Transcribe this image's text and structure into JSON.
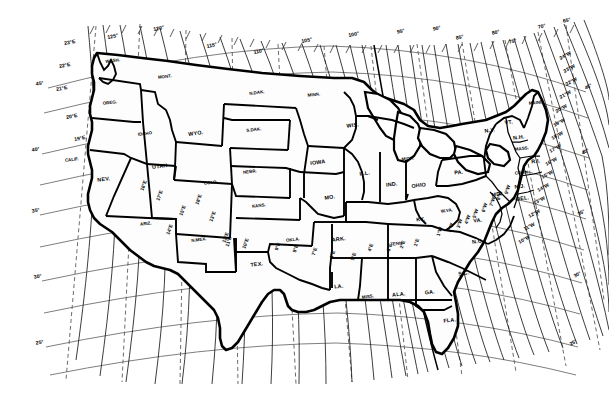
{
  "map": {
    "title": "Isogonic Chart of the United States",
    "subject": "magnetic declination",
    "projection": "conic",
    "background_color": "#ffffff",
    "line_color": "#000000",
    "graticule_color": "#6f6f6f"
  },
  "graticule": {
    "longitude_labels": [
      "125°",
      "120°",
      "115°",
      "110°",
      "105°",
      "100°",
      "95°",
      "90°",
      "85°",
      "80°",
      "75°",
      "70°",
      "65°"
    ],
    "latitude_labels_left": [
      "45°",
      "40°",
      "35°",
      "30°",
      "25°"
    ],
    "latitude_labels_right": [
      "45°",
      "40°",
      "35°",
      "30°",
      "25°"
    ]
  },
  "declination": {
    "east_labels": [
      "23°E",
      "22°E",
      "21°E",
      "20°E",
      "19°E",
      "18°E",
      "17°E",
      "16°E",
      "15°E",
      "14°E",
      "13°E",
      "12°E",
      "11°E",
      "10°E",
      "9°E",
      "8°E",
      "7°E",
      "6°E",
      "5°E",
      "4°E",
      "3°E",
      "2°E",
      "1°E"
    ],
    "west_labels": [
      "24°W",
      "23°W",
      "22°W",
      "21°W",
      "20°W",
      "19°W",
      "18°W",
      "17°W",
      "16°W",
      "15°W",
      "14°W",
      "13°W",
      "12°W",
      "11°W",
      "10°W",
      "9°W",
      "8°W",
      "7°W",
      "6°W",
      "5°W",
      "4°W",
      "3°W",
      "2°W",
      "1°W"
    ]
  },
  "edge_labels": {
    "left": [
      {
        "text": "23°E",
        "x": 70,
        "y": 44
      },
      {
        "text": "22°E",
        "x": 65,
        "y": 67
      },
      {
        "text": "21°E",
        "x": 62,
        "y": 90
      },
      {
        "text": "20°E",
        "x": 72,
        "y": 118
      },
      {
        "text": "19°E",
        "x": 80,
        "y": 140
      },
      {
        "text": "45°",
        "x": 40,
        "y": 85
      },
      {
        "text": "40°",
        "x": 36,
        "y": 151
      },
      {
        "text": "35°",
        "x": 36,
        "y": 212
      },
      {
        "text": "30°",
        "x": 38,
        "y": 278
      },
      {
        "text": "25°",
        "x": 40,
        "y": 344
      }
    ],
    "top": [
      {
        "text": "125°",
        "x": 113,
        "y": 38
      },
      {
        "text": "120°",
        "x": 159,
        "y": 30
      },
      {
        "text": "115°",
        "x": 212,
        "y": 47
      },
      {
        "text": "110°",
        "x": 259,
        "y": 53
      },
      {
        "text": "105°",
        "x": 307,
        "y": 42
      },
      {
        "text": "100°",
        "x": 354,
        "y": 36
      },
      {
        "text": "95°",
        "x": 401,
        "y": 33
      },
      {
        "text": "90°",
        "x": 437,
        "y": 30
      },
      {
        "text": "85°",
        "x": 460,
        "y": 39
      },
      {
        "text": "80°",
        "x": 496,
        "y": 34
      },
      {
        "text": "75°",
        "x": 513,
        "y": 43
      },
      {
        "text": "70°",
        "x": 542,
        "y": 28
      },
      {
        "text": "65°",
        "x": 567,
        "y": 22
      }
    ],
    "right": [
      {
        "text": "24°W",
        "x": 566,
        "y": 57
      },
      {
        "text": "23°W",
        "x": 570,
        "y": 70
      },
      {
        "text": "22°W",
        "x": 572,
        "y": 83
      },
      {
        "text": "21°W",
        "x": 566,
        "y": 96
      },
      {
        "text": "20°W",
        "x": 562,
        "y": 110
      },
      {
        "text": "19°W",
        "x": 560,
        "y": 124
      },
      {
        "text": "18°W",
        "x": 558,
        "y": 137
      },
      {
        "text": "17°W",
        "x": 556,
        "y": 150
      },
      {
        "text": "16°W",
        "x": 552,
        "y": 163
      },
      {
        "text": "15°W",
        "x": 548,
        "y": 176
      },
      {
        "text": "14°W",
        "x": 544,
        "y": 189
      },
      {
        "text": "13°W",
        "x": 540,
        "y": 202
      },
      {
        "text": "12°W",
        "x": 535,
        "y": 215
      },
      {
        "text": "11°W",
        "x": 530,
        "y": 228
      },
      {
        "text": "10°W",
        "x": 525,
        "y": 241
      },
      {
        "text": "45°",
        "x": 589,
        "y": 88
      },
      {
        "text": "40°",
        "x": 586,
        "y": 153
      },
      {
        "text": "35°",
        "x": 582,
        "y": 214
      },
      {
        "text": "30°",
        "x": 578,
        "y": 276
      },
      {
        "text": "25°",
        "x": 574,
        "y": 344
      }
    ],
    "interior": [
      {
        "text": "15°E",
        "x": 184,
        "y": 211
      },
      {
        "text": "14°E",
        "x": 171,
        "y": 230
      },
      {
        "text": "13°E",
        "x": 214,
        "y": 217
      },
      {
        "text": "12°E",
        "x": 227,
        "y": 238
      },
      {
        "text": "11°E",
        "x": 230,
        "y": 242
      },
      {
        "text": "10°E",
        "x": 247,
        "y": 244
      },
      {
        "text": "9°E",
        "x": 279,
        "y": 247
      },
      {
        "text": "8°E",
        "x": 297,
        "y": 249
      },
      {
        "text": "7°E",
        "x": 316,
        "y": 252
      },
      {
        "text": "6°E",
        "x": 334,
        "y": 255
      },
      {
        "text": "5°E",
        "x": 355,
        "y": 257
      },
      {
        "text": "4°E",
        "x": 372,
        "y": 248
      },
      {
        "text": "3°E",
        "x": 391,
        "y": 248
      },
      {
        "text": "2°E",
        "x": 404,
        "y": 245
      },
      {
        "text": "1°E",
        "x": 418,
        "y": 243
      },
      {
        "text": "1°W",
        "x": 441,
        "y": 232
      },
      {
        "text": "2°W",
        "x": 452,
        "y": 228
      },
      {
        "text": "3°W",
        "x": 461,
        "y": 224
      },
      {
        "text": "4°W",
        "x": 469,
        "y": 220
      },
      {
        "text": "5°W",
        "x": 477,
        "y": 214
      },
      {
        "text": "6°W",
        "x": 486,
        "y": 208
      },
      {
        "text": "7°W",
        "x": 494,
        "y": 202
      },
      {
        "text": "8°W",
        "x": 501,
        "y": 196
      },
      {
        "text": "9°W",
        "x": 509,
        "y": 190
      },
      {
        "text": "18°E",
        "x": 200,
        "y": 200
      },
      {
        "text": "17°E",
        "x": 161,
        "y": 196
      },
      {
        "text": "16°E",
        "x": 145,
        "y": 186
      }
    ]
  },
  "states": [
    {
      "abbr": "WASH.",
      "x": 113,
      "y": 62
    },
    {
      "abbr": "OREG.",
      "x": 110,
      "y": 104
    },
    {
      "abbr": "CALIF.",
      "x": 72,
      "y": 161
    },
    {
      "abbr": "NEV.",
      "x": 104,
      "y": 181
    },
    {
      "abbr": "IDAHO",
      "x": 145,
      "y": 135
    },
    {
      "abbr": "MONT.",
      "x": 165,
      "y": 78
    },
    {
      "abbr": "WYO.",
      "x": 196,
      "y": 135
    },
    {
      "abbr": "UTAH",
      "x": 160,
      "y": 168
    },
    {
      "abbr": "COLO.",
      "x": 211,
      "y": 184
    },
    {
      "abbr": "ARIZ.",
      "x": 146,
      "y": 225
    },
    {
      "abbr": "N.MEX.",
      "x": 199,
      "y": 241
    },
    {
      "abbr": "TEX.",
      "x": 257,
      "y": 266
    },
    {
      "abbr": "OKLA.",
      "x": 293,
      "y": 241
    },
    {
      "abbr": "KANS.",
      "x": 259,
      "y": 207
    },
    {
      "abbr": "NEBR.",
      "x": 250,
      "y": 173
    },
    {
      "abbr": "S.DAK.",
      "x": 254,
      "y": 131
    },
    {
      "abbr": "N.DAK.",
      "x": 257,
      "y": 94
    },
    {
      "abbr": "MINN.",
      "x": 314,
      "y": 96
    },
    {
      "abbr": "IOWA",
      "x": 318,
      "y": 164
    },
    {
      "abbr": "MO.",
      "x": 330,
      "y": 199
    },
    {
      "abbr": "ARK.",
      "x": 339,
      "y": 241
    },
    {
      "abbr": "LA.",
      "x": 339,
      "y": 288
    },
    {
      "abbr": "MISS.",
      "x": 368,
      "y": 298
    },
    {
      "abbr": "ALA.",
      "x": 399,
      "y": 296
    },
    {
      "abbr": "GA.",
      "x": 430,
      "y": 294
    },
    {
      "abbr": "FLA.",
      "x": 450,
      "y": 322
    },
    {
      "abbr": "TENN.",
      "x": 397,
      "y": 245
    },
    {
      "abbr": "KY.",
      "x": 421,
      "y": 221
    },
    {
      "abbr": "ILL.",
      "x": 365,
      "y": 175
    },
    {
      "abbr": "IND.",
      "x": 392,
      "y": 186
    },
    {
      "abbr": "OHIO",
      "x": 419,
      "y": 187
    },
    {
      "abbr": "MICH.",
      "x": 408,
      "y": 160
    },
    {
      "abbr": "WIS.",
      "x": 353,
      "y": 127
    },
    {
      "abbr": "W.VA.",
      "x": 447,
      "y": 212
    },
    {
      "abbr": "VA.",
      "x": 478,
      "y": 222
    },
    {
      "abbr": "N.C.",
      "x": 478,
      "y": 243
    },
    {
      "abbr": "S.C.",
      "x": 464,
      "y": 275
    },
    {
      "abbr": "PA.",
      "x": 459,
      "y": 174
    },
    {
      "abbr": "N.Y.",
      "x": 490,
      "y": 132
    },
    {
      "abbr": "VT.",
      "x": 509,
      "y": 124
    },
    {
      "abbr": "N.H.",
      "x": 519,
      "y": 139
    },
    {
      "abbr": "MASS.",
      "x": 522,
      "y": 150
    },
    {
      "abbr": "R.I.",
      "x": 536,
      "y": 163
    },
    {
      "abbr": "CONN.",
      "x": 522,
      "y": 174
    },
    {
      "abbr": "N.J.",
      "x": 520,
      "y": 188
    },
    {
      "abbr": "DEL.",
      "x": 523,
      "y": 200
    },
    {
      "abbr": "MD.",
      "x": 497,
      "y": 196
    },
    {
      "abbr": "MAINE",
      "x": 536,
      "y": 104
    }
  ]
}
